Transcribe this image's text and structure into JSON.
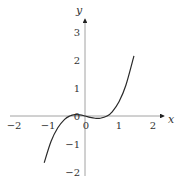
{
  "chart_data": {
    "type": "line",
    "title": "",
    "xlabel": "x",
    "ylabel": "y",
    "xlim": [
      -2.2,
      2.4
    ],
    "ylim": [
      -2.1,
      3.5
    ],
    "grid": false,
    "x_ticks": [
      -2,
      -1,
      0,
      1,
      2
    ],
    "x_tick_labels": [
      "−2",
      "−1",
      "0",
      "1",
      "2"
    ],
    "y_ticks": [
      -2,
      -1,
      0,
      1,
      2,
      3
    ],
    "y_tick_labels": [
      "−2",
      "−1",
      "0",
      "1",
      "2",
      "3"
    ],
    "series": [
      {
        "name": "f(x)",
        "domain": [
          -1.2,
          1.44
        ],
        "x": [
          -1.2,
          -1.0,
          -0.8,
          -0.6,
          -0.45,
          -0.3,
          -0.15,
          0.0,
          0.15,
          0.3,
          0.45,
          0.65,
          0.8,
          1.0,
          1.2,
          1.44
        ],
        "y": [
          -1.67,
          -0.91,
          -0.42,
          -0.12,
          0.0,
          0.05,
          0.04,
          0.0,
          -0.05,
          -0.08,
          -0.08,
          0.0,
          0.15,
          0.51,
          1.09,
          2.15
        ]
      }
    ]
  }
}
